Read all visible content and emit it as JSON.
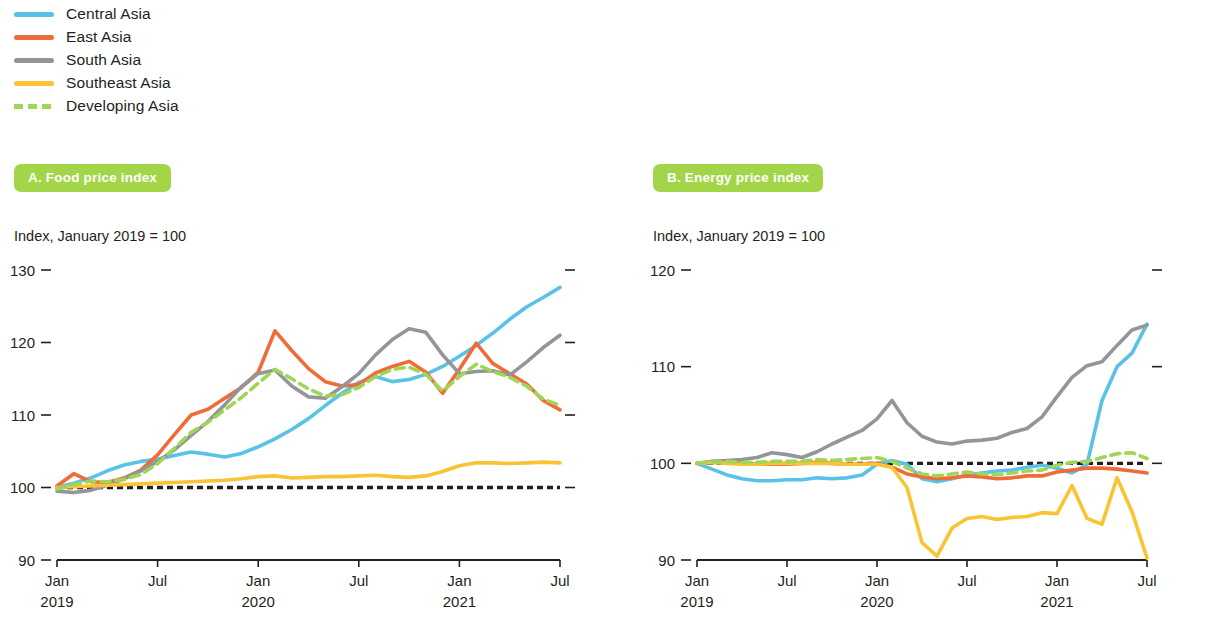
{
  "legend": {
    "items": [
      {
        "label": "Central Asia",
        "color": "#5bc2e7",
        "style": "solid",
        "key": "central"
      },
      {
        "label": "East Asia",
        "color": "#ef6b38",
        "style": "solid",
        "key": "east"
      },
      {
        "label": "South Asia",
        "color": "#939598",
        "style": "solid",
        "key": "south"
      },
      {
        "label": "Southeast Asia",
        "color": "#f9c434",
        "style": "solid",
        "key": "southeast"
      },
      {
        "label": "Developing Asia",
        "color": "#a0d556",
        "style": "dashed",
        "key": "developing"
      }
    ]
  },
  "panels": [
    {
      "id": "A",
      "badge": "A. Food price index",
      "subtitle": "Index, January 2019 = 100"
    },
    {
      "id": "B",
      "badge": "B. Energy price index",
      "subtitle": "Index, January 2019 = 100"
    }
  ],
  "chart_data": [
    {
      "type": "line",
      "title": "A. Food price index",
      "subtitle": "Index, January 2019 = 100",
      "xlabel": "",
      "ylabel": "Index, January 2019 = 100",
      "ylim": [
        90,
        130
      ],
      "yticks": [
        90,
        100,
        110,
        120,
        130
      ],
      "grid": false,
      "legend_position": "top-left-shared",
      "baseline": 100,
      "x": [
        "Jan 2019",
        "Feb 2019",
        "Mar 2019",
        "Apr 2019",
        "May 2019",
        "Jun 2019",
        "Jul 2019",
        "Aug 2019",
        "Sep 2019",
        "Oct 2019",
        "Nov 2019",
        "Dec 2019",
        "Jan 2020",
        "Feb 2020",
        "Mar 2020",
        "Apr 2020",
        "May 2020",
        "Jun 2020",
        "Jul 2020",
        "Aug 2020",
        "Sep 2020",
        "Oct 2020",
        "Nov 2020",
        "Dec 2020",
        "Jan 2021",
        "Feb 2021",
        "Mar 2021",
        "Apr 2021",
        "May 2021",
        "Jun 2021",
        "Jul 2021"
      ],
      "xticks": [
        "Jan",
        "Jul",
        "Jan",
        "Jul",
        "Jan",
        "Jul"
      ],
      "xtick_years": [
        "2019",
        "",
        "2020",
        "",
        "2021",
        ""
      ],
      "series": [
        {
          "name": "Central Asia",
          "color": "#5bc2e7",
          "style": "solid",
          "values": [
            100.0,
            100.6,
            101.3,
            102.3,
            103.1,
            103.6,
            103.9,
            104.4,
            104.9,
            104.6,
            104.2,
            104.7,
            105.6,
            106.7,
            108.0,
            109.5,
            111.3,
            113.0,
            114.5,
            115.3,
            114.6,
            114.9,
            115.6,
            116.7,
            118.1,
            119.6,
            121.3,
            123.2,
            124.9,
            126.2,
            127.6
          ]
        },
        {
          "name": "East Asia",
          "color": "#ef6b38",
          "style": "solid",
          "values": [
            100.2,
            101.9,
            100.8,
            100.7,
            101.3,
            102.4,
            104.5,
            107.3,
            110.0,
            110.8,
            112.3,
            113.8,
            115.9,
            121.6,
            118.9,
            116.4,
            114.6,
            114.0,
            114.2,
            115.8,
            116.7,
            117.4,
            115.9,
            113.0,
            116.3,
            119.9,
            117.1,
            115.7,
            114.3,
            112.0,
            110.7
          ]
        },
        {
          "name": "South Asia",
          "color": "#939598",
          "style": "solid",
          "values": [
            99.5,
            99.3,
            99.6,
            100.3,
            101.2,
            102.3,
            103.6,
            105.2,
            107.2,
            109.1,
            111.4,
            113.9,
            115.7,
            116.2,
            114.0,
            112.5,
            112.3,
            113.9,
            115.7,
            118.3,
            120.4,
            121.9,
            121.4,
            118.3,
            115.7,
            116.0,
            116.1,
            115.5,
            117.3,
            119.3,
            121.0
          ]
        },
        {
          "name": "Southeast Asia",
          "color": "#f9c434",
          "style": "solid",
          "values": [
            100.0,
            100.1,
            100.2,
            100.3,
            100.4,
            100.5,
            100.6,
            100.7,
            100.8,
            100.9,
            101.0,
            101.2,
            101.5,
            101.6,
            101.3,
            101.4,
            101.5,
            101.5,
            101.6,
            101.7,
            101.5,
            101.4,
            101.6,
            102.2,
            103.0,
            103.4,
            103.4,
            103.3,
            103.4,
            103.5,
            103.4
          ]
        },
        {
          "name": "Developing Asia",
          "color": "#a0d556",
          "style": "dashed",
          "values": [
            99.8,
            100.4,
            100.9,
            100.8,
            101.1,
            101.8,
            103.3,
            105.4,
            107.6,
            109.0,
            110.7,
            112.4,
            114.4,
            116.3,
            115.0,
            113.6,
            112.6,
            112.8,
            113.8,
            115.3,
            116.3,
            116.6,
            115.6,
            113.3,
            115.3,
            117.0,
            116.0,
            115.2,
            114.0,
            112.2,
            111.3
          ]
        }
      ]
    },
    {
      "type": "line",
      "title": "B. Energy price index",
      "subtitle": "Index, January 2019 = 100",
      "xlabel": "",
      "ylabel": "Index, January 2019 = 100",
      "ylim": [
        90,
        120
      ],
      "yticks": [
        90,
        100,
        110,
        120
      ],
      "grid": false,
      "legend_position": "top-left-shared",
      "baseline": 100,
      "x": [
        "Jan 2019",
        "Feb 2019",
        "Mar 2019",
        "Apr 2019",
        "May 2019",
        "Jun 2019",
        "Jul 2019",
        "Aug 2019",
        "Sep 2019",
        "Oct 2019",
        "Nov 2019",
        "Dec 2019",
        "Jan 2020",
        "Feb 2020",
        "Mar 2020",
        "Apr 2020",
        "May 2020",
        "Jun 2020",
        "Jul 2020",
        "Aug 2020",
        "Sep 2020",
        "Oct 2020",
        "Nov 2020",
        "Dec 2020",
        "Jan 2021",
        "Feb 2021",
        "Mar 2021",
        "Apr 2021",
        "May 2021",
        "Jun 2021",
        "Jul 2021"
      ],
      "xticks": [
        "Jan",
        "Jul",
        "Jan",
        "Jul",
        "Jan",
        "Jul"
      ],
      "xtick_years": [
        "2019",
        "",
        "2020",
        "",
        "2021",
        ""
      ],
      "series": [
        {
          "name": "Central Asia",
          "color": "#5bc2e7",
          "style": "solid",
          "values": [
            100.0,
            99.4,
            98.8,
            98.4,
            98.2,
            98.2,
            98.3,
            98.3,
            98.5,
            98.4,
            98.5,
            98.8,
            99.9,
            100.3,
            99.9,
            98.4,
            98.1,
            98.4,
            98.8,
            99.0,
            99.2,
            99.3,
            99.6,
            99.8,
            99.5,
            99.0,
            99.9,
            106.5,
            110.0,
            111.4,
            114.4
          ]
        },
        {
          "name": "East Asia",
          "color": "#ef6b38",
          "style": "solid",
          "values": [
            100.0,
            100.1,
            100.1,
            100.0,
            99.9,
            99.9,
            99.9,
            100.0,
            100.1,
            100.0,
            99.9,
            99.9,
            100.0,
            99.6,
            98.9,
            98.6,
            98.4,
            98.5,
            98.7,
            98.6,
            98.4,
            98.5,
            98.7,
            98.7,
            99.1,
            99.3,
            99.5,
            99.5,
            99.4,
            99.2,
            99.0
          ]
        },
        {
          "name": "South Asia",
          "color": "#939598",
          "style": "solid",
          "values": [
            100.0,
            100.2,
            100.3,
            100.4,
            100.6,
            101.1,
            100.9,
            100.6,
            101.2,
            102.0,
            102.7,
            103.4,
            104.6,
            106.5,
            104.2,
            102.8,
            102.2,
            102.0,
            102.3,
            102.4,
            102.6,
            103.2,
            103.6,
            104.8,
            106.9,
            108.9,
            110.1,
            110.5,
            112.2,
            113.8,
            114.3
          ]
        },
        {
          "name": "Southeast Asia",
          "color": "#f9c434",
          "style": "solid",
          "values": [
            100.0,
            100.1,
            100.0,
            99.9,
            99.9,
            100.0,
            100.0,
            100.0,
            100.0,
            100.0,
            99.9,
            99.9,
            99.9,
            99.6,
            97.5,
            91.8,
            90.4,
            93.3,
            94.3,
            94.5,
            94.2,
            94.4,
            94.5,
            94.9,
            94.8,
            97.7,
            94.3,
            93.7,
            98.5,
            95.0,
            90.2
          ]
        },
        {
          "name": "Developing Asia",
          "color": "#a0d556",
          "style": "dashed",
          "values": [
            100.0,
            100.1,
            100.2,
            100.1,
            100.1,
            100.2,
            100.2,
            100.2,
            100.4,
            100.3,
            100.4,
            100.5,
            100.6,
            100.2,
            99.5,
            98.9,
            98.7,
            98.9,
            99.1,
            98.9,
            98.8,
            99.0,
            99.2,
            99.3,
            99.8,
            100.1,
            100.2,
            100.6,
            101.0,
            101.1,
            100.5
          ]
        }
      ]
    }
  ]
}
